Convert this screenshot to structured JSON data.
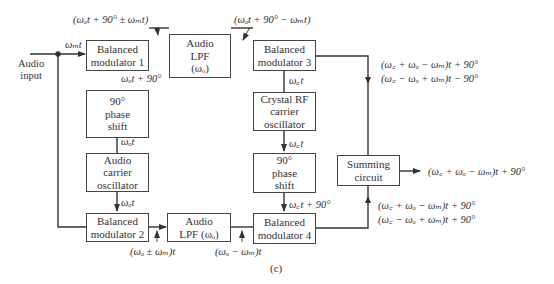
{
  "diagram": {
    "caption": "(c)",
    "blocks": {
      "bm1": "Balanced modulator 1",
      "lpf_top": "Audio LPF (ωo)",
      "bm3": "Balanced modulator 3",
      "phase_left": "90° phase shift",
      "audio_osc": "Audio carrier oscillator",
      "crystal_osc": "Crystal RF carrier oscillator",
      "phase_right": "90° phase shift",
      "summing": "Summing circuit",
      "bm2": "Balanced modulator 2",
      "lpf_bottom": "Audio LPF (ωo)",
      "bm4": "Balanced modulator 4"
    },
    "block_lines": {
      "bm1": [
        "Balanced",
        "modulator 1"
      ],
      "lpf_top": [
        "Audio",
        "LPF",
        "(ωₒ)"
      ],
      "bm3": [
        "Balanced",
        "modulator 3"
      ],
      "phase_left": [
        "90°",
        "phase",
        "shift"
      ],
      "audio_osc": [
        "Audio",
        "carrier",
        "oscillator"
      ],
      "crystal_osc": [
        "Crystal RF",
        "carrier",
        "oscillator"
      ],
      "phase_right": [
        "90°",
        "phase",
        "shift"
      ],
      "summing": [
        "Summing",
        "circuit"
      ],
      "bm2": [
        "Balanced",
        "modulator 2"
      ],
      "lpf_bottom": [
        "Audio",
        "LPF (ωₒ)"
      ],
      "bm4": [
        "Balanced",
        "modulator 4"
      ]
    },
    "labels": {
      "audio_input": [
        "Audio",
        "input"
      ],
      "wm_t": "ωₘt",
      "bm1_out": "(ωₒt + 90° ± ωₘt)",
      "lpf_top_out": "(ωₒt + 90° − ωₘt)",
      "phase_left_out": "ωₒt + 90°",
      "osc_up": "ωₒt",
      "osc_down": "ωₒt",
      "crystal_up": "ω꜀t",
      "crystal_down": "ω꜀t",
      "phase_right_out": "ω꜀t + 90°",
      "bm3_out_1": "(ω꜀ + ωₒ − ωₘ)t + 90°",
      "bm3_out_2": "(ω꜀ − ωₒ + ωₘ)t − 90°",
      "sum_out": "(ω꜀ + ωₒ − ωₘ)t + 90°",
      "bm4_out_1": "(ω꜀ + ωₒ − ωₘ)t + 90°",
      "bm4_out_2": "(ω꜀ − ωₒ + ωₘ)t + 90°",
      "bm2_out": "(ωₒ ± ωₘ)t",
      "lpf_bottom_out": "(ωₒ − ωₘ)t"
    }
  }
}
